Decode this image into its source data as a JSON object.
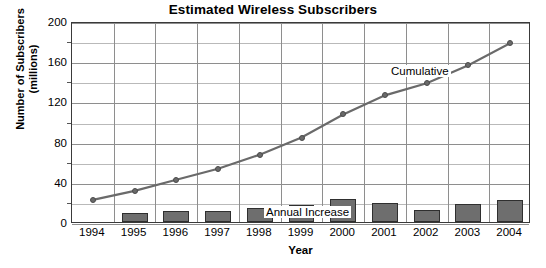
{
  "chart_data": {
    "type": "bar",
    "title": "Estimated Wireless Subscribers",
    "xlabel": "Year",
    "ylabel": "Number of Subscribers\n(millions)",
    "ylabel_line1": "Number of Subscribers",
    "ylabel_line2": "(millions)",
    "categories": [
      "1994",
      "1995",
      "1996",
      "1997",
      "1998",
      "1999",
      "2000",
      "2001",
      "2002",
      "2003",
      "2004"
    ],
    "ylim": [
      0,
      200
    ],
    "ytick_values": [
      0,
      40,
      80,
      120,
      160,
      200
    ],
    "ytick_labels": [
      "0",
      "40",
      "80",
      "120",
      "160",
      "200"
    ],
    "yminor_step": 20,
    "grid": true,
    "legend_position": "inline-annotations",
    "series": [
      {
        "name": "Cumulative",
        "type": "line",
        "color": "#6a6a6a",
        "values": [
          24,
          33,
          44,
          55,
          69,
          86,
          109,
          128,
          140,
          158,
          180
        ]
      },
      {
        "name": "Annual Increase",
        "type": "bar",
        "color": "#6e6e6e",
        "values": [
          0,
          9,
          11,
          11,
          14,
          17,
          23,
          19,
          12,
          18,
          22
        ]
      }
    ],
    "annotations": [
      {
        "text": "Cumulative",
        "series": "Cumulative"
      },
      {
        "text": "Annual Increase",
        "series": "Annual Increase"
      }
    ]
  }
}
